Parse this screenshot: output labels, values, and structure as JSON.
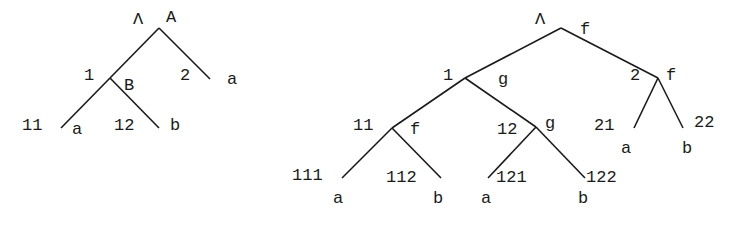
{
  "trees": [
    {
      "id": "left",
      "nodes": [
        {
          "pos": "Λ",
          "symbol": "A",
          "x": 159,
          "y": 28,
          "posX": 133,
          "posY": 24,
          "symX": 166,
          "symY": 22
        },
        {
          "pos": "1",
          "symbol": "B",
          "x": 110,
          "y": 78,
          "posX": 84,
          "posY": 80,
          "symX": 124,
          "symY": 90
        },
        {
          "pos": "2",
          "symbol": "a",
          "x": 210,
          "y": 79,
          "posX": 180,
          "posY": 80,
          "symX": 227,
          "symY": 84
        },
        {
          "pos": "11",
          "symbol": "a",
          "x": 61,
          "y": 128,
          "posX": 22,
          "posY": 130,
          "symX": 72,
          "symY": 134
        },
        {
          "pos": "12",
          "symbol": "b",
          "x": 159,
          "y": 128,
          "posX": 114,
          "posY": 130,
          "symX": 170,
          "symY": 130
        }
      ],
      "edges": [
        [
          0,
          1
        ],
        [
          0,
          2
        ],
        [
          1,
          3
        ],
        [
          1,
          4
        ]
      ]
    },
    {
      "id": "right",
      "nodes": [
        {
          "pos": "Λ",
          "symbol": "f",
          "x": 561,
          "y": 28,
          "posX": 535,
          "posY": 24,
          "symX": 580,
          "symY": 34
        },
        {
          "pos": "1",
          "symbol": "g",
          "x": 465,
          "y": 78,
          "posX": 443,
          "posY": 80,
          "symX": 498,
          "symY": 84
        },
        {
          "pos": "2",
          "symbol": "f",
          "x": 658,
          "y": 78,
          "posX": 630,
          "posY": 80,
          "symX": 666,
          "symY": 80
        },
        {
          "pos": "11",
          "symbol": "f",
          "x": 392,
          "y": 128,
          "posX": 353,
          "posY": 130,
          "symX": 410,
          "symY": 134
        },
        {
          "pos": "12",
          "symbol": "g",
          "x": 536,
          "y": 127,
          "posX": 497,
          "posY": 134,
          "symX": 545,
          "symY": 128
        },
        {
          "pos": "21",
          "symbol": "a",
          "x": 634,
          "y": 128,
          "posX": 594,
          "posY": 130,
          "symX": 621,
          "symY": 153
        },
        {
          "pos": "22",
          "symbol": "b",
          "x": 683,
          "y": 128,
          "posX": 694,
          "posY": 127,
          "symX": 682,
          "symY": 153
        },
        {
          "pos": "111",
          "symbol": "a",
          "x": 342,
          "y": 178,
          "posX": 292,
          "posY": 180,
          "symX": 333,
          "symY": 203
        },
        {
          "pos": "112",
          "symbol": "b",
          "x": 441,
          "y": 178,
          "posX": 386,
          "posY": 182,
          "symX": 433,
          "symY": 203
        },
        {
          "pos": "121",
          "symbol": "a",
          "x": 488,
          "y": 178,
          "posX": 496,
          "posY": 182,
          "symX": 481,
          "symY": 203
        },
        {
          "pos": "122",
          "symbol": "b",
          "x": 585,
          "y": 178,
          "posX": 586,
          "posY": 182,
          "symX": 578,
          "symY": 203
        }
      ],
      "edges": [
        [
          0,
          1
        ],
        [
          0,
          2
        ],
        [
          1,
          3
        ],
        [
          1,
          4
        ],
        [
          2,
          5
        ],
        [
          2,
          6
        ],
        [
          3,
          7
        ],
        [
          3,
          8
        ],
        [
          4,
          9
        ],
        [
          4,
          10
        ]
      ]
    }
  ]
}
